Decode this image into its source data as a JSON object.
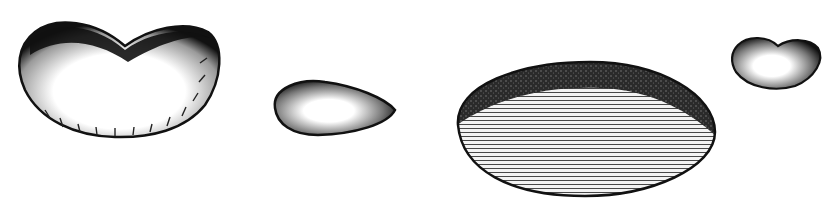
{
  "illustration": {
    "style": "black-and-white engraving",
    "background": "#ffffff",
    "ink": "#111111",
    "figures": [
      {
        "id": "large-bean",
        "shape": "kidney",
        "shading": "dark top edge, radial hatching below"
      },
      {
        "id": "small-elongated-seed",
        "shape": "teardrop",
        "shading": "dark rim, light center"
      },
      {
        "id": "large-oval-seed",
        "shape": "ovoid",
        "shading": "stippled top band, horizontal line hatching"
      },
      {
        "id": "small-bean",
        "shape": "kidney",
        "shading": "dark rim, light center"
      }
    ]
  }
}
